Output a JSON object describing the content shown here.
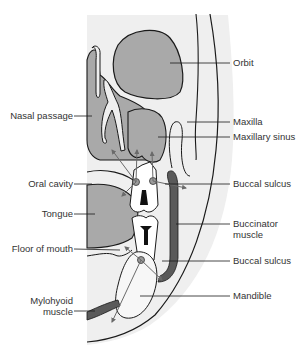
{
  "figure": {
    "colors": {
      "background": "#ffffff",
      "tissue_light": "#efefef",
      "cavity_gray": "#a9a9a9",
      "muscle_dark": "#5a5a5a",
      "outline": "#1a1a1a",
      "arrow": "#6a6a6a",
      "label_text": "#333333"
    }
  },
  "labels": {
    "left": [
      {
        "id": "nasal-passage",
        "text": "Nasal passage"
      },
      {
        "id": "oral-cavity",
        "text": "Oral cavity"
      },
      {
        "id": "tongue",
        "text": "Tongue"
      },
      {
        "id": "floor-of-mouth",
        "text": "Floor of mouth"
      },
      {
        "id": "mylohyoid-muscle",
        "text": "Mylohyoid\nmuscle",
        "line1": "Mylohyoid",
        "line2": "muscle"
      }
    ],
    "right": [
      {
        "id": "orbit",
        "text": "Orbit"
      },
      {
        "id": "maxilla",
        "text": "Maxilla"
      },
      {
        "id": "maxillary-sinus",
        "text": "Maxillary sinus"
      },
      {
        "id": "buccal-sulcus-upper",
        "text": "Buccal sulcus"
      },
      {
        "id": "buccinator-muscle",
        "text": "Buccinator\nmuscle",
        "line1": "Buccinator",
        "line2": "muscle"
      },
      {
        "id": "buccal-sulcus-lower",
        "text": "Buccal sulcus"
      },
      {
        "id": "mandible",
        "text": "Mandible"
      }
    ]
  }
}
